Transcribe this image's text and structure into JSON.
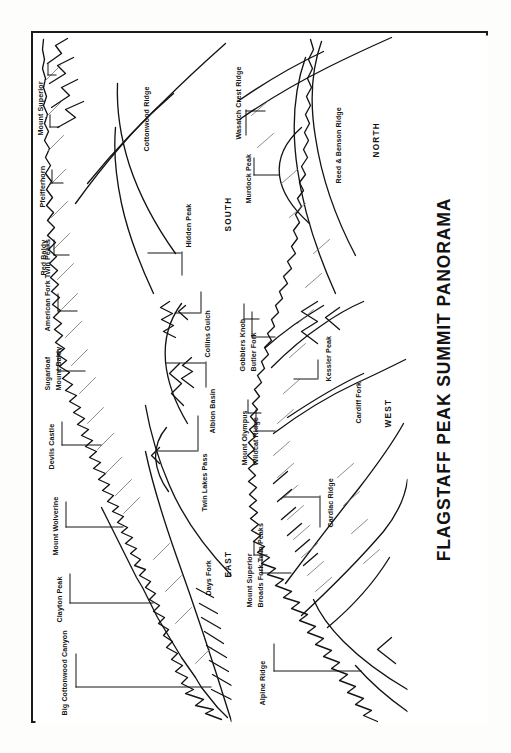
{
  "document": {
    "title": "FLAGSTAFF PEAK SUMMIT PANORAMA",
    "type": "panorama-sketch",
    "orientation": "rotated-90-ccw",
    "border_color": "#1b1b1b",
    "ink_color": "#141414",
    "paper_color": "#ffffff"
  },
  "panorama_top": {
    "name": "upper-panorama-strip",
    "compass_start": "EAST",
    "compass_end": "SOUTH",
    "compass_labels": [
      {
        "text": "EAST"
      },
      {
        "text": "SOUTH"
      }
    ],
    "labels": [
      {
        "text": "Big Cottonwood Canyon"
      },
      {
        "text": "Clayton Peak"
      },
      {
        "text": "Mount Wolverine"
      },
      {
        "text": "Devils Castle"
      },
      {
        "text": "Sugarloaf"
      },
      {
        "text": "Mount Baldy"
      },
      {
        "text": "American Fork Twin Peaks"
      },
      {
        "text": "Red Baldy"
      },
      {
        "text": "Pfeifferhorn"
      },
      {
        "text": "Mount Superior"
      },
      {
        "text": "Days Fork"
      },
      {
        "text": "Twin Lakes Pass"
      },
      {
        "text": "Albion Basin"
      },
      {
        "text": "Collins Gulch"
      },
      {
        "text": "Hidden Peak"
      },
      {
        "text": "Cottonwood Ridge"
      }
    ]
  },
  "panorama_bottom": {
    "name": "lower-panorama-strip",
    "compass_start": "WEST",
    "compass_end": "NORTH",
    "compass_labels": [
      {
        "text": "WEST"
      },
      {
        "text": "NORTH"
      }
    ],
    "labels": [
      {
        "text": "Alpine Ridge"
      },
      {
        "text": "Mount Superior"
      },
      {
        "text": "Broads Fork Twin Peaks"
      },
      {
        "text": "Cardiac Ridge"
      },
      {
        "text": "Cardiff Fork"
      },
      {
        "text": "Mount Olympus"
      },
      {
        "text": "Wildcat Ridge"
      },
      {
        "text": "Kessler Peak"
      },
      {
        "text": "Gobblers Knob"
      },
      {
        "text": "Butler Fork"
      },
      {
        "text": "Murdock Peak"
      },
      {
        "text": "Wasatch Crest Ridge"
      },
      {
        "text": "Reed & Benson Ridge"
      },
      {
        "text": "NORTH"
      }
    ]
  }
}
